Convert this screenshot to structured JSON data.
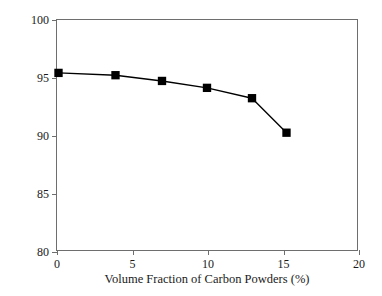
{
  "chart_data": {
    "type": "line",
    "title": "",
    "xlabel": "Volume Fraction of Carbon Powders (%)",
    "ylabel": "Ratio of Recoverable Strain (%)",
    "xlim": [
      0,
      20
    ],
    "ylim": [
      80,
      100
    ],
    "xticks": [
      "0",
      "5",
      "10",
      "15",
      "20"
    ],
    "xtick_values": [
      0,
      5,
      10,
      15,
      20
    ],
    "yticks": [
      "80",
      "85",
      "90",
      "95",
      "100"
    ],
    "ytick_values": [
      80,
      85,
      90,
      95,
      100
    ],
    "grid": false,
    "legend": null,
    "marker": "filled-square",
    "line_color": "#000000",
    "marker_color": "#000000",
    "series": [
      {
        "name": "Ratio of Recoverable Strain",
        "x": [
          0.1,
          3.9,
          7.0,
          10.0,
          13.0,
          15.3
        ],
        "y": [
          95.4,
          95.2,
          94.7,
          94.1,
          93.2,
          90.2
        ]
      }
    ]
  }
}
